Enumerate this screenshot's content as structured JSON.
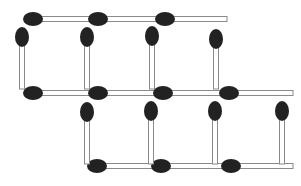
{
  "puzzle": {
    "title": "Matchstick puzzle",
    "type": "matchstick-grid",
    "match_count": 20,
    "colors": {
      "head": "#222222",
      "stick_fill": "#ffffff",
      "stick_stroke": "#8a8a8a",
      "background": "#ffffff"
    },
    "horizontal_matches": [
      {
        "id": "h1",
        "head_x": 33,
        "y": 19,
        "length": 66
      },
      {
        "id": "h2",
        "head_x": 98,
        "y": 19,
        "length": 66
      },
      {
        "id": "h3",
        "head_x": 165,
        "y": 19,
        "length": 62
      },
      {
        "id": "h4",
        "head_x": 33,
        "y": 93,
        "length": 66
      },
      {
        "id": "h5",
        "head_x": 98,
        "y": 93,
        "length": 66
      },
      {
        "id": "h6",
        "head_x": 163,
        "y": 93,
        "length": 64
      },
      {
        "id": "h7",
        "head_x": 229,
        "y": 93,
        "length": 64
      },
      {
        "id": "h8",
        "head_x": 97,
        "y": 166,
        "length": 64
      },
      {
        "id": "h9",
        "head_x": 161,
        "y": 166,
        "length": 66
      },
      {
        "id": "h10",
        "head_x": 231,
        "y": 166,
        "length": 62
      }
    ],
    "vertical_matches": [
      {
        "id": "v1",
        "x": 22,
        "head_y": 37,
        "length": 52
      },
      {
        "id": "v2",
        "x": 87,
        "head_y": 37,
        "length": 52
      },
      {
        "id": "v3",
        "x": 152,
        "head_y": 36,
        "length": 53
      },
      {
        "id": "v4",
        "x": 216,
        "head_y": 39,
        "length": 50
      },
      {
        "id": "v5",
        "x": 87,
        "head_y": 112,
        "length": 52
      },
      {
        "id": "v6",
        "x": 151,
        "head_y": 111,
        "length": 53
      },
      {
        "id": "v7",
        "x": 215,
        "head_y": 111,
        "length": 53
      },
      {
        "id": "v8",
        "x": 282,
        "head_y": 111,
        "length": 53
      }
    ]
  }
}
